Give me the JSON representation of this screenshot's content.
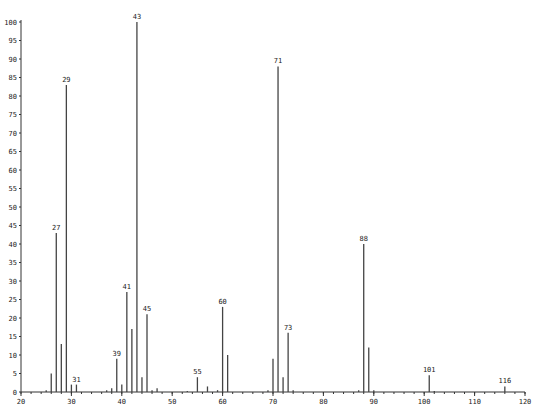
{
  "chart_data": {
    "type": "bar",
    "title": "",
    "xlabel": "",
    "ylabel": "",
    "xlim": [
      20,
      120
    ],
    "ylim": [
      0,
      100
    ],
    "x_ticks": [
      20,
      30,
      40,
      50,
      60,
      70,
      80,
      90,
      100,
      110,
      120
    ],
    "y_ticks": [
      0,
      5,
      10,
      15,
      20,
      25,
      30,
      35,
      40,
      45,
      50,
      55,
      60,
      65,
      70,
      75,
      80,
      85,
      90,
      95,
      100
    ],
    "grid": false,
    "legend": null,
    "peaks": [
      {
        "mz": 25,
        "intensity": 0.5
      },
      {
        "mz": 26,
        "intensity": 5
      },
      {
        "mz": 27,
        "intensity": 43,
        "label": "27"
      },
      {
        "mz": 28,
        "intensity": 13
      },
      {
        "mz": 29,
        "intensity": 83,
        "label": "29"
      },
      {
        "mz": 30,
        "intensity": 2
      },
      {
        "mz": 31,
        "intensity": 2,
        "label": "31"
      },
      {
        "mz": 37,
        "intensity": 0.5
      },
      {
        "mz": 38,
        "intensity": 1
      },
      {
        "mz": 39,
        "intensity": 9,
        "label": "39"
      },
      {
        "mz": 40,
        "intensity": 2
      },
      {
        "mz": 41,
        "intensity": 27,
        "label": "41"
      },
      {
        "mz": 42,
        "intensity": 17
      },
      {
        "mz": 43,
        "intensity": 100,
        "label": "43"
      },
      {
        "mz": 44,
        "intensity": 4
      },
      {
        "mz": 45,
        "intensity": 21,
        "label": "45"
      },
      {
        "mz": 46,
        "intensity": 0.5
      },
      {
        "mz": 47,
        "intensity": 1
      },
      {
        "mz": 53,
        "intensity": 0.3
      },
      {
        "mz": 55,
        "intensity": 4,
        "label": "55"
      },
      {
        "mz": 57,
        "intensity": 1.5
      },
      {
        "mz": 59,
        "intensity": 0.5
      },
      {
        "mz": 60,
        "intensity": 23,
        "label": "60"
      },
      {
        "mz": 61,
        "intensity": 10
      },
      {
        "mz": 69,
        "intensity": 0.5
      },
      {
        "mz": 70,
        "intensity": 9
      },
      {
        "mz": 71,
        "intensity": 88,
        "label": "71"
      },
      {
        "mz": 72,
        "intensity": 4
      },
      {
        "mz": 73,
        "intensity": 16,
        "label": "73"
      },
      {
        "mz": 74,
        "intensity": 0.5
      },
      {
        "mz": 87,
        "intensity": 0.5
      },
      {
        "mz": 88,
        "intensity": 40,
        "label": "88"
      },
      {
        "mz": 89,
        "intensity": 12
      },
      {
        "mz": 90,
        "intensity": 0.5
      },
      {
        "mz": 101,
        "intensity": 4.5,
        "label": "101"
      },
      {
        "mz": 102,
        "intensity": 0.3
      },
      {
        "mz": 116,
        "intensity": 1.5,
        "label": "116"
      }
    ]
  }
}
